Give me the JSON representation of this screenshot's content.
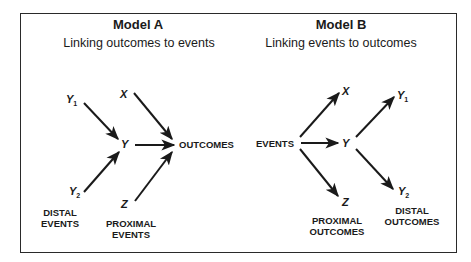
{
  "model_a": {
    "title": "Model A",
    "subtitle": "Linking outcomes to events",
    "nodes": {
      "y1": {
        "var": "Y",
        "sub": "1"
      },
      "x": {
        "var": "X"
      },
      "y": {
        "var": "Y"
      },
      "outcomes": "OUTCOMES",
      "y2": {
        "var": "Y",
        "sub": "2"
      },
      "distal_caption": [
        "DISTAL",
        "EVENTS"
      ],
      "z": {
        "var": "Z"
      },
      "proximal_caption": [
        "PROXIMAL",
        "EVENTS"
      ]
    },
    "edges": [
      {
        "from": "Y1",
        "to": "Y"
      },
      {
        "from": "Y2",
        "to": "Y"
      },
      {
        "from": "X",
        "to": "OUTCOMES"
      },
      {
        "from": "Y",
        "to": "OUTCOMES"
      },
      {
        "from": "Z",
        "to": "OUTCOMES"
      }
    ]
  },
  "model_b": {
    "title": "Model B",
    "subtitle": "Linking events to outcomes",
    "nodes": {
      "events": "EVENTS",
      "x": {
        "var": "X"
      },
      "y": {
        "var": "Y"
      },
      "y1": {
        "var": "Y",
        "sub": "1"
      },
      "z": {
        "var": "Z"
      },
      "y2": {
        "var": "Y",
        "sub": "2"
      },
      "proximal_caption": [
        "PROXIMAL",
        "OUTCOMES"
      ],
      "distal_caption": [
        "DISTAL",
        "OUTCOMES"
      ]
    },
    "edges": [
      {
        "from": "EVENTS",
        "to": "X"
      },
      {
        "from": "EVENTS",
        "to": "Y"
      },
      {
        "from": "EVENTS",
        "to": "Z"
      },
      {
        "from": "Y",
        "to": "Y1"
      },
      {
        "from": "Y",
        "to": "Y2"
      }
    ]
  }
}
